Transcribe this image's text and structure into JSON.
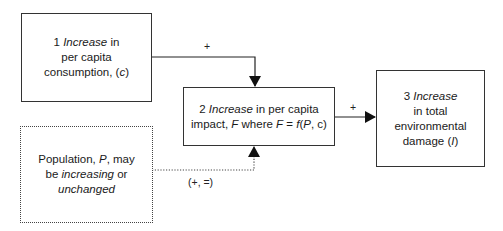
{
  "diagram": {
    "nodes": [
      {
        "id": "1",
        "number": "1",
        "lines": [
          [
            "Increase",
            " in"
          ],
          [
            "per capita"
          ],
          [
            "consumption, (",
            "c",
            ")"
          ]
        ],
        "border": "solid"
      },
      {
        "id": "2",
        "number": "2",
        "lines": [
          [
            "Increase",
            " in per capita"
          ],
          [
            "impact, ",
            "F",
            " where ",
            "F",
            " = ",
            "f",
            "(",
            "P",
            ", c)"
          ]
        ],
        "border": "solid"
      },
      {
        "id": "3",
        "number": "3",
        "lines": [
          [
            "Increase"
          ],
          [
            "in total"
          ],
          [
            "environmental"
          ],
          [
            "damage (",
            "I",
            ")"
          ]
        ],
        "border": "solid"
      },
      {
        "id": "4",
        "lines": [
          [
            "Population, ",
            "P",
            ", may"
          ],
          [
            "be ",
            "increasing",
            " or"
          ],
          [
            "unchanged"
          ]
        ],
        "border": "dotted"
      }
    ],
    "edges": [
      {
        "from": "1",
        "to": "2",
        "label": "+",
        "style": "solid"
      },
      {
        "from": "2",
        "to": "3",
        "label": "+",
        "style": "solid"
      },
      {
        "from": "4",
        "to": "2",
        "label": "(+, =)",
        "style": "dotted"
      }
    ],
    "text": {
      "box1_num": "1 ",
      "box1_l1_it": "Increase",
      "box1_l1_rest": " in",
      "box1_l2": "per capita",
      "box1_l3a": "consumption, (",
      "box1_l3_it": "c",
      "box1_l3b": ")",
      "box2_num": "2 ",
      "box2_l1_it": "Increase",
      "box2_l1_rest": " in per capita",
      "box2_l2a": "impact, ",
      "box2_F1": "F",
      "box2_l2b": " where ",
      "box2_F2": "F",
      "box2_l2c": " = ",
      "box2_f": "f",
      "box2_l2d": "(",
      "box2_P": "P",
      "box2_l2e": ", c)",
      "box3_num": "3 ",
      "box3_l1_it": "Increase",
      "box3_l2": "in total",
      "box3_l3": "environmental",
      "box3_l4a": "damage (",
      "box3_I": "I",
      "box3_l4b": ")",
      "box4_l1a": "Population, ",
      "box4_P": "P",
      "box4_l1b": ", may",
      "box4_l2a": "be ",
      "box4_l2_it": "increasing",
      "box4_l2b": " or",
      "box4_l3_it": "unchanged",
      "edge1_label": "+",
      "edge2_label": "+",
      "edge3_label": "(+, =)"
    }
  }
}
